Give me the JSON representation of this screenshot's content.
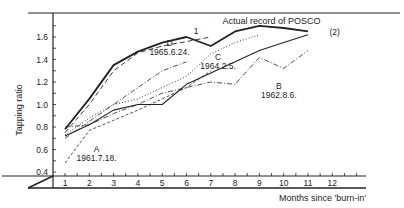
{
  "chart_data": {
    "type": "line",
    "title": "",
    "xlabel": "Months since 'burn-in'",
    "ylabel": "Tapping ratio",
    "x": [
      1,
      2,
      3,
      4,
      5,
      6,
      7,
      8,
      9,
      10,
      11,
      12
    ],
    "xticks": [
      "1",
      "2",
      "3",
      "4",
      "5",
      "6",
      "7",
      "8",
      "9",
      "10",
      "11",
      "12"
    ],
    "yticks": [
      "0.4",
      "0.6",
      "0.8",
      "1.0",
      "1.2",
      "1.4",
      "1.6"
    ],
    "ylim": [
      0.4,
      1.75
    ],
    "xlim": [
      0.5,
      13
    ],
    "grid": false,
    "series": [
      {
        "name": "Actual record of POSCO",
        "style": "solid-thick",
        "x": [
          1,
          2,
          3,
          4,
          5,
          6,
          7,
          8,
          9,
          10,
          11
        ],
        "values": [
          0.78,
          1.05,
          1.35,
          1.47,
          1.55,
          1.6,
          1.52,
          1.65,
          1.7,
          1.68,
          1.65
        ]
      },
      {
        "name": "1",
        "style": "dashed",
        "x": [
          1,
          2,
          3,
          4,
          5,
          6,
          7
        ],
        "values": [
          0.75,
          1.0,
          1.3,
          1.46,
          1.52,
          1.56,
          1.6
        ]
      },
      {
        "name": "(2)",
        "style": "solid",
        "x": [
          1,
          2,
          3,
          4,
          5,
          6,
          7,
          8,
          9,
          10,
          11
        ],
        "values": [
          0.72,
          0.82,
          0.95,
          1.0,
          1.0,
          1.18,
          1.28,
          1.38,
          1.48,
          1.55,
          1.62
        ]
      },
      {
        "name": "D 1965.6.24.",
        "style": "dash-dot",
        "x": [
          1,
          2,
          3,
          4,
          5,
          6
        ],
        "values": [
          0.7,
          0.85,
          1.0,
          1.15,
          1.3,
          1.38
        ]
      },
      {
        "name": "C 1964.2.5.",
        "style": "dotted",
        "x": [
          1,
          2,
          3,
          4,
          5,
          6,
          7,
          8,
          9
        ],
        "values": [
          0.73,
          0.88,
          1.0,
          1.05,
          1.15,
          1.25,
          1.45,
          1.55,
          1.62
        ]
      },
      {
        "name": "B 1962.8.6.",
        "style": "dash-dot",
        "x": [
          1,
          2,
          3,
          4,
          5,
          6,
          7,
          8,
          9,
          10,
          11
        ],
        "values": [
          0.8,
          0.82,
          0.92,
          1.0,
          1.1,
          1.15,
          1.2,
          1.18,
          1.42,
          1.32,
          1.48
        ]
      },
      {
        "name": "A 1961.7.18.",
        "style": "short-dash",
        "x": [
          1,
          2,
          3,
          4,
          5,
          6,
          7
        ],
        "values": [
          0.48,
          0.77,
          0.86,
          0.95,
          1.05,
          1.15,
          1.3
        ]
      }
    ],
    "annotations": [
      {
        "text": "Actual record of POSCO",
        "x": 9.5,
        "y": 1.72
      },
      {
        "text": "1",
        "x": 6.4,
        "y": 1.63
      },
      {
        "text": "(2)",
        "x": 12.1,
        "y": 1.62
      },
      {
        "text": "D",
        "x": 5.3,
        "y": 1.52
      },
      {
        "text": "1965.6.24.",
        "x": 5.3,
        "y": 1.44
      },
      {
        "text": "C",
        "x": 7.3,
        "y": 1.4
      },
      {
        "text": "1964.2.5.",
        "x": 7.3,
        "y": 1.32
      },
      {
        "text": "B",
        "x": 9.8,
        "y": 1.14
      },
      {
        "text": "1962.8.6.",
        "x": 9.8,
        "y": 1.06
      },
      {
        "text": "A",
        "x": 2.3,
        "y": 0.58
      },
      {
        "text": "1961.7.18.",
        "x": 2.3,
        "y": 0.5
      }
    ],
    "legend_position": "none"
  }
}
